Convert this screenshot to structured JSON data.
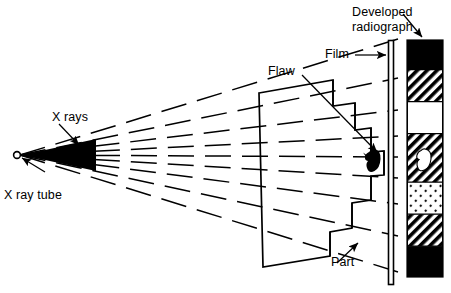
{
  "figure": {
    "title_visible": false,
    "kind": "radiography-schematic",
    "stroke_color": "#000000",
    "background_color": "#ffffff"
  },
  "labels": {
    "x_rays": "X rays",
    "x_ray_tube": "X ray tube",
    "flaw": "Flaw",
    "film": "Film",
    "part": "Part",
    "developed_radiograph_line1": "Developed",
    "developed_radiograph_line2": "radiograph"
  },
  "source": {
    "name": "x-ray-tube-focal-spot",
    "cx": 17,
    "cy": 155,
    "r": 3.4
  },
  "beam": {
    "ray_count": 9,
    "dashed": true,
    "apex_x": 20,
    "apex_y": 155,
    "cone_half_angle_deg": 23
  },
  "part": {
    "left_x": 150,
    "step_count": 7,
    "right_edge_x": 388,
    "description": "stepped wedge block of varying thickness"
  },
  "flaw": {
    "color": "#000000",
    "cx": 373,
    "cy": 160,
    "width": 14,
    "height": 22
  },
  "film": {
    "x": 388,
    "top_y": 40,
    "bottom_y": 285,
    "width": 6
  },
  "radiograph": {
    "x": 407,
    "y": 40,
    "width": 36,
    "height": 237,
    "bands": [
      {
        "index": 1,
        "pattern": "solid-black",
        "label": "unexposed-edge",
        "height_fraction": 0.125
      },
      {
        "index": 2,
        "pattern": "hatch-dense",
        "label": "dark-gray",
        "height_fraction": 0.135
      },
      {
        "index": 3,
        "pattern": "white",
        "label": "light",
        "height_fraction": 0.135
      },
      {
        "index": 4,
        "pattern": "hatch-dense",
        "label": "dark-gray-with-flaw-image",
        "height_fraction": 0.205
      },
      {
        "index": 5,
        "pattern": "dots-light",
        "label": "mid-light",
        "height_fraction": 0.135
      },
      {
        "index": 6,
        "pattern": "hatch-dense",
        "label": "dark-gray",
        "height_fraction": 0.135
      },
      {
        "index": 7,
        "pattern": "solid-black",
        "label": "unexposed-edge",
        "height_fraction": 0.13
      }
    ],
    "flaw_image": {
      "color": "#ffffff",
      "cx": 425,
      "cy": 160,
      "width": 13,
      "height": 20
    }
  }
}
